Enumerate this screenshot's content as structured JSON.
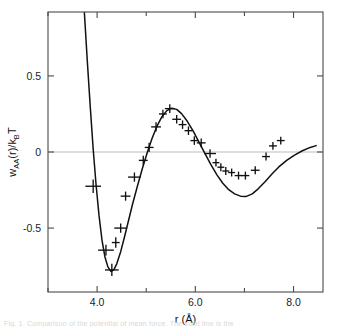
{
  "figure": {
    "background_color": "#ffffff",
    "curve_color": "#111111",
    "axis_color": "#4a4a4a",
    "zeroline_color": "#bdbdbd",
    "caption_text": "Fig. 1. Comparison of the potential of mean force. The solid line is the"
  },
  "chart_data": {
    "type": "scatter",
    "title": "",
    "xlabel": "r (Å)",
    "ylabel": "wₐₐ(r)/kᵦT",
    "ylabel_parts": {
      "w": "w",
      "sub1": "AA",
      "paren": "(r)/k",
      "sub2": "B",
      "tail": "T"
    },
    "xlabel_parts": {
      "r": "r",
      "unit": "(Å)"
    },
    "xlim": [
      3.0,
      8.6
    ],
    "ylim": [
      -0.92,
      0.92
    ],
    "xticks_major": [
      4.0,
      6.0,
      8.0
    ],
    "xticklabels": [
      "4.0",
      "6.0",
      "8.0"
    ],
    "xticks_minor": [
      3.0,
      5.0,
      7.0
    ],
    "yticks_major": [
      0.5,
      0.0,
      -0.5
    ],
    "yticklabels": [
      "0.5",
      "0",
      "-0.5"
    ],
    "grid": false,
    "legend": null,
    "zero_reference_line": 0.0,
    "series": [
      {
        "name": "Simulation data (with error bars)",
        "type": "scatter_errorbar",
        "marker": "cross",
        "points": [
          {
            "x": 3.92,
            "y": -0.225,
            "xerr": 0.16,
            "yerr": 0.045
          },
          {
            "x": 4.18,
            "y": -0.645,
            "xerr": 0.16,
            "yerr": 0.035
          },
          {
            "x": 4.3,
            "y": -0.775,
            "xerr": 0.14,
            "yerr": 0.04
          },
          {
            "x": 4.38,
            "y": -0.595,
            "xerr": 0.08,
            "yerr": 0.035
          },
          {
            "x": 4.48,
            "y": -0.5,
            "xerr": 0.13,
            "yerr": 0.03
          },
          {
            "x": 4.58,
            "y": -0.29,
            "xerr": 0.1,
            "yerr": 0.03
          },
          {
            "x": 4.76,
            "y": -0.165,
            "xerr": 0.13,
            "yerr": 0.03
          },
          {
            "x": 4.94,
            "y": -0.055,
            "xerr": 0.09,
            "yerr": 0.03
          },
          {
            "x": 5.06,
            "y": 0.03,
            "xerr": 0.09,
            "yerr": 0.03
          },
          {
            "x": 5.2,
            "y": 0.165,
            "xerr": 0.1,
            "yerr": 0.03
          },
          {
            "x": 5.34,
            "y": 0.25,
            "xerr": 0.08,
            "yerr": 0.028
          },
          {
            "x": 5.48,
            "y": 0.285,
            "xerr": 0.1,
            "yerr": 0.028
          },
          {
            "x": 5.62,
            "y": 0.215,
            "xerr": 0.09,
            "yerr": 0.028
          },
          {
            "x": 5.74,
            "y": 0.18,
            "xerr": 0.08,
            "yerr": 0.028
          },
          {
            "x": 5.86,
            "y": 0.14,
            "xerr": 0.08,
            "yerr": 0.028
          },
          {
            "x": 5.98,
            "y": 0.075,
            "xerr": 0.08,
            "yerr": 0.028
          },
          {
            "x": 6.12,
            "y": 0.06,
            "xerr": 0.09,
            "yerr": 0.028
          },
          {
            "x": 6.3,
            "y": -0.01,
            "xerr": 0.12,
            "yerr": 0.028
          },
          {
            "x": 6.42,
            "y": -0.07,
            "xerr": 0.07,
            "yerr": 0.026
          },
          {
            "x": 6.52,
            "y": -0.1,
            "xerr": 0.07,
            "yerr": 0.026
          },
          {
            "x": 6.62,
            "y": -0.125,
            "xerr": 0.07,
            "yerr": 0.026
          },
          {
            "x": 6.74,
            "y": -0.135,
            "xerr": 0.07,
            "yerr": 0.026
          },
          {
            "x": 6.88,
            "y": -0.155,
            "xerr": 0.08,
            "yerr": 0.026
          },
          {
            "x": 7.02,
            "y": -0.155,
            "xerr": 0.08,
            "yerr": 0.026
          },
          {
            "x": 7.22,
            "y": -0.12,
            "xerr": 0.09,
            "yerr": 0.026
          },
          {
            "x": 7.44,
            "y": -0.03,
            "xerr": 0.08,
            "yerr": 0.026
          },
          {
            "x": 7.58,
            "y": 0.04,
            "xerr": 0.08,
            "yerr": 0.026
          },
          {
            "x": 7.74,
            "y": 0.075,
            "xerr": 0.08,
            "yerr": 0.026
          }
        ]
      },
      {
        "name": "Theory (solid line)",
        "type": "line",
        "points": [
          {
            "x": 3.74,
            "y": 0.92
          },
          {
            "x": 3.8,
            "y": 0.6
          },
          {
            "x": 3.86,
            "y": 0.3
          },
          {
            "x": 3.92,
            "y": 0.02
          },
          {
            "x": 3.98,
            "y": -0.22
          },
          {
            "x": 4.04,
            "y": -0.42
          },
          {
            "x": 4.1,
            "y": -0.58
          },
          {
            "x": 4.16,
            "y": -0.69
          },
          {
            "x": 4.22,
            "y": -0.755
          },
          {
            "x": 4.28,
            "y": -0.785
          },
          {
            "x": 4.34,
            "y": -0.775
          },
          {
            "x": 4.4,
            "y": -0.735
          },
          {
            "x": 4.48,
            "y": -0.655
          },
          {
            "x": 4.56,
            "y": -0.555
          },
          {
            "x": 4.64,
            "y": -0.45
          },
          {
            "x": 4.72,
            "y": -0.345
          },
          {
            "x": 4.82,
            "y": -0.225
          },
          {
            "x": 4.92,
            "y": -0.11
          },
          {
            "x": 5.02,
            "y": -0.005
          },
          {
            "x": 5.12,
            "y": 0.09
          },
          {
            "x": 5.22,
            "y": 0.17
          },
          {
            "x": 5.32,
            "y": 0.232
          },
          {
            "x": 5.42,
            "y": 0.272
          },
          {
            "x": 5.52,
            "y": 0.288
          },
          {
            "x": 5.62,
            "y": 0.28
          },
          {
            "x": 5.72,
            "y": 0.252
          },
          {
            "x": 5.84,
            "y": 0.2
          },
          {
            "x": 5.96,
            "y": 0.135
          },
          {
            "x": 6.08,
            "y": 0.062
          },
          {
            "x": 6.2,
            "y": -0.012
          },
          {
            "x": 6.32,
            "y": -0.085
          },
          {
            "x": 6.44,
            "y": -0.15
          },
          {
            "x": 6.56,
            "y": -0.205
          },
          {
            "x": 6.68,
            "y": -0.248
          },
          {
            "x": 6.8,
            "y": -0.275
          },
          {
            "x": 6.92,
            "y": -0.29
          },
          {
            "x": 7.04,
            "y": -0.292
          },
          {
            "x": 7.16,
            "y": -0.275
          },
          {
            "x": 7.28,
            "y": -0.242
          },
          {
            "x": 7.42,
            "y": -0.195
          },
          {
            "x": 7.56,
            "y": -0.145
          },
          {
            "x": 7.7,
            "y": -0.098
          },
          {
            "x": 7.86,
            "y": -0.055
          },
          {
            "x": 8.02,
            "y": -0.02
          },
          {
            "x": 8.18,
            "y": 0.008
          },
          {
            "x": 8.34,
            "y": 0.03
          },
          {
            "x": 8.46,
            "y": 0.042
          }
        ]
      }
    ]
  }
}
